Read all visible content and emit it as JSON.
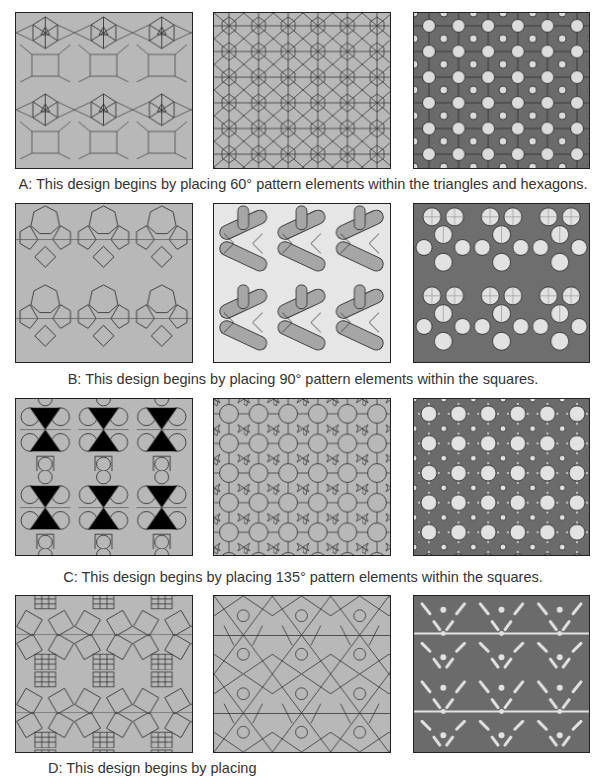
{
  "figure": {
    "rows": [
      {
        "id": "A",
        "caption": "A: This design begins by placing 60° pattern elements within the triangles and hexagons.",
        "panels": [
          {
            "stage": "underlying-tessellation",
            "fill": "#b8b8b8",
            "line": "#333333"
          },
          {
            "stage": "pattern-construction",
            "fill": "#b8b8b8",
            "line": "#333333"
          },
          {
            "stage": "interlaced-result",
            "fill": "#dcdcdc",
            "band": "#6b6b6b",
            "line": "#222222"
          }
        ]
      },
      {
        "id": "B",
        "caption": "B: This design begins by placing 90° pattern elements within the squares.",
        "panels": [
          {
            "stage": "underlying-tessellation",
            "fill": "#b8b8b8",
            "line": "#333333"
          },
          {
            "stage": "pattern-construction",
            "fill": "#a6a6a6",
            "light": "#e6e6e6",
            "line": "#333333"
          },
          {
            "stage": "filled-result",
            "fill": "#6e6e6e",
            "light": "#e2e2e2",
            "line": "#222222"
          }
        ]
      },
      {
        "id": "C",
        "caption": "C: This design begins by placing 135° pattern elements within the squares.",
        "panels": [
          {
            "stage": "underlying-tessellation",
            "fill": "#b8b8b8",
            "line": "#333333"
          },
          {
            "stage": "pattern-construction",
            "fill": "#b8b8b8",
            "line": "#333333"
          },
          {
            "stage": "interlaced-result",
            "fill": "#e2e2e2",
            "band": "#6b6b6b",
            "line": "#222222"
          }
        ]
      },
      {
        "id": "D",
        "caption": "D: This design begins by placing",
        "panels": [
          {
            "stage": "underlying-tessellation",
            "fill": "#b8b8b8",
            "line": "#333333"
          },
          {
            "stage": "pattern-construction",
            "fill": "#b8b8b8",
            "line": "#333333"
          },
          {
            "stage": "interlaced-result",
            "fill": "#e2e2e2",
            "band": "#6b6b6b",
            "line": "#222222"
          }
        ]
      }
    ]
  }
}
